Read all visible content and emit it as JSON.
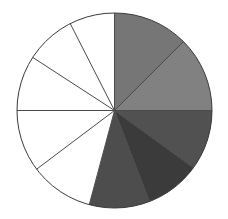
{
  "chart_data": {
    "type": "pie",
    "title": "",
    "subtitle": "",
    "xlabel": "",
    "ylabel": "",
    "legend": "none",
    "grid": false,
    "total_slices": 10,
    "start_angle_deg": 90,
    "direction": "clockwise",
    "units": "degrees",
    "categories": [
      "Slice 1",
      "Slice 2",
      "Slice 3",
      "Slice 4",
      "Slice 5",
      "Slice 6",
      "Slice 7",
      "Slice 8",
      "Slice 9",
      "Slice 10"
    ],
    "values": [
      45,
      45,
      36,
      33,
      36,
      38,
      34,
      33,
      30,
      20
    ],
    "percentages": [
      12.5,
      12.5,
      10.0,
      9.2,
      10.0,
      10.6,
      9.4,
      9.2,
      8.3,
      5.6
    ],
    "filled_count": 5,
    "unfilled_count": 5,
    "slices": [
      {
        "label": "Slice 1",
        "start_deg": 90,
        "end_deg": 45,
        "sweep_deg": 45,
        "color": "#767676",
        "filled": true
      },
      {
        "label": "Slice 2",
        "start_deg": 45,
        "end_deg": 0,
        "sweep_deg": 45,
        "color": "#818181",
        "filled": true
      },
      {
        "label": "Slice 3",
        "start_deg": 0,
        "end_deg": -36,
        "sweep_deg": 36,
        "color": "#515151",
        "filled": true
      },
      {
        "label": "Slice 4",
        "start_deg": -36,
        "end_deg": -69,
        "sweep_deg": 33,
        "color": "#3b3b3b",
        "filled": true
      },
      {
        "label": "Slice 5",
        "start_deg": -69,
        "end_deg": -105,
        "sweep_deg": 36,
        "color": "#4d4d4d",
        "filled": true
      },
      {
        "label": "Slice 6",
        "start_deg": -105,
        "end_deg": -143,
        "sweep_deg": 38,
        "color": "#ffffff",
        "filled": false
      },
      {
        "label": "Slice 7",
        "start_deg": -143,
        "end_deg": -177,
        "sweep_deg": 34,
        "color": "#ffffff",
        "filled": false
      },
      {
        "label": "Slice 8",
        "start_deg": 180,
        "end_deg": 147,
        "sweep_deg": 33,
        "color": "#ffffff",
        "filled": false
      },
      {
        "label": "Slice 9",
        "start_deg": 147,
        "end_deg": 117,
        "sweep_deg": 30,
        "color": "#ffffff",
        "filled": false
      },
      {
        "label": "Slice 10",
        "start_deg": 117,
        "end_deg": 90,
        "sweep_deg": 27,
        "color": "#ffffff",
        "filled": false
      }
    ],
    "geometry": {
      "center_x": 114.5,
      "center_y": 110.5,
      "radius": 97.5
    },
    "style": {
      "outline_color": "#3a3a3a",
      "outline_width": 1,
      "spoke_color": "#4a4a4a",
      "spoke_width": 1,
      "background": "#ffffff",
      "unfilled_color": "#ffffff"
    }
  }
}
